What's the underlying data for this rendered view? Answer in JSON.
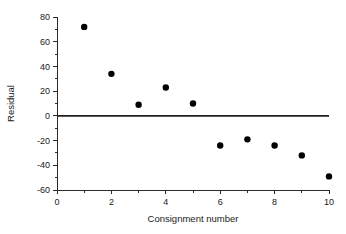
{
  "chart_data": {
    "type": "scatter",
    "title": "",
    "xlabel": "Consignment number",
    "ylabel": "Residual",
    "x": [
      1,
      2,
      3,
      4,
      5,
      6,
      7,
      8,
      9,
      10
    ],
    "values": [
      72,
      34,
      9,
      23,
      10,
      -24,
      -19,
      -24,
      -32,
      -49
    ],
    "series": [
      {
        "name": "Residual",
        "values": [
          72,
          34,
          9,
          23,
          10,
          -24,
          -19,
          -24,
          -32,
          -49
        ]
      }
    ],
    "xlim": [
      0,
      10
    ],
    "ylim": [
      -60,
      80
    ],
    "xticks": [
      0,
      2,
      4,
      6,
      8,
      10
    ],
    "xtick_labels": [
      "0",
      "2",
      "4",
      "6",
      "8",
      "10"
    ],
    "xminor_ticks": [
      1,
      3,
      5,
      7,
      9
    ],
    "yticks": [
      80,
      60,
      40,
      20,
      0,
      -20,
      -40,
      -60
    ],
    "ytick_labels": [
      "80",
      "60",
      "40",
      "20",
      "0",
      "-20",
      "-40",
      "-60"
    ],
    "yminor_ticks": [
      70,
      50,
      30,
      10,
      -10,
      -30,
      -50
    ],
    "grid": false,
    "legend": false,
    "reference_line": {
      "orientation": "horizontal",
      "value": 0,
      "color": "#1f1f1f"
    },
    "marker": {
      "shape": "circle",
      "color": "#000000",
      "size": 3.2
    },
    "colors": {
      "axis": "#2b2b2b",
      "text": "#1a1a1a",
      "marker": "#000000",
      "reference": "#1f1f1f",
      "background": "#ffffff"
    }
  }
}
